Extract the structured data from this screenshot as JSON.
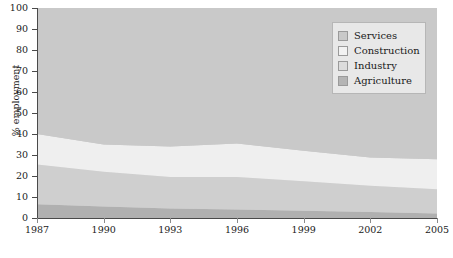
{
  "chart_data": {
    "type": "area",
    "stacked": true,
    "title": "",
    "subtitle": "",
    "xlabel": "",
    "ylabel": "% employment",
    "xlim": [
      1987,
      2005
    ],
    "ylim": [
      0,
      100
    ],
    "grid": false,
    "legend_position": "top-right",
    "x": [
      1987,
      1990,
      1993,
      1996,
      1999,
      2002,
      2005
    ],
    "x_tick_labels": [
      "1987",
      "1990",
      "1993",
      "1996",
      "1999",
      "2002",
      "2005"
    ],
    "y_tick_labels": [
      "0",
      "10",
      "20",
      "30",
      "40",
      "50",
      "60",
      "70",
      "80",
      "90",
      "100"
    ],
    "y_ticks": [
      0,
      10,
      20,
      30,
      40,
      50,
      60,
      70,
      80,
      90,
      100
    ],
    "stack_order_bottom_to_top": [
      "Agriculture",
      "Industry",
      "Construction",
      "Services"
    ],
    "series": [
      {
        "name": "Agriculture",
        "color": "#b0b0b0",
        "values": [
          6.5,
          5.5,
          4.5,
          4.0,
          3.5,
          2.8,
          2.2
        ]
      },
      {
        "name": "Industry",
        "color": "#cfcfcf",
        "values": [
          19.0,
          16.5,
          15.0,
          15.5,
          14.0,
          12.5,
          11.5
        ]
      },
      {
        "name": "Construction",
        "color": "#efefef",
        "values": [
          14.5,
          13.0,
          14.5,
          16.0,
          14.5,
          13.5,
          14.3
        ]
      },
      {
        "name": "Services",
        "color": "#c9c9c9",
        "values": [
          60.0,
          65.0,
          66.0,
          64.5,
          68.0,
          71.2,
          72.0
        ]
      }
    ],
    "cumulative_top_boundaries": {
      "Agriculture": [
        6.5,
        5.5,
        4.5,
        4.0,
        3.5,
        2.8,
        2.2
      ],
      "Industry": [
        25.5,
        22.0,
        19.5,
        19.5,
        17.5,
        15.3,
        13.7
      ],
      "Construction": [
        40.0,
        35.0,
        34.0,
        35.5,
        32.0,
        28.8,
        28.0
      ],
      "Services": [
        100,
        100,
        100,
        100,
        100,
        100,
        100
      ]
    }
  },
  "axes": {
    "y_title": "% employment"
  },
  "legend": {
    "items": [
      {
        "label": "Services",
        "swatch": "#c9c9c9"
      },
      {
        "label": "Construction",
        "swatch": "#f2f2f2"
      },
      {
        "label": "Industry",
        "swatch": "#dcdcdc"
      },
      {
        "label": "Agriculture",
        "swatch": "#b4b4b4"
      }
    ]
  }
}
